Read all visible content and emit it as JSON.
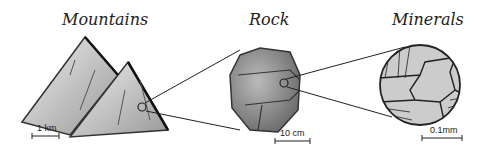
{
  "panels": [
    {
      "title": "Mountains",
      "scale_label": "1 km"
    },
    {
      "title": "Rock",
      "scale_label": "10 cm"
    },
    {
      "title": "Minerals",
      "scale_label": "0.1mm"
    }
  ]
}
